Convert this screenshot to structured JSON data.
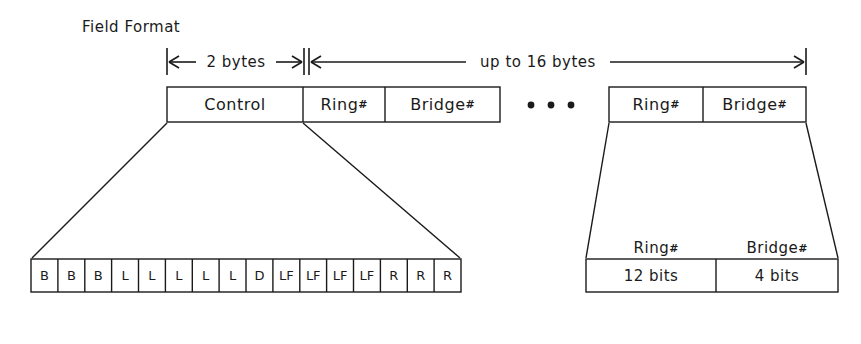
{
  "diagram": {
    "title": "Field Format",
    "stroke_color": "#1a1a1a",
    "background_color": "#ffffff"
  },
  "dimensions": [
    {
      "label": "2 bytes",
      "x_start": 167,
      "x_end": 303
    },
    {
      "label": "up to 16 bytes",
      "x_start": 303,
      "x_end": 806
    }
  ],
  "top_row": {
    "left_group": {
      "fields": [
        {
          "label": "Control",
          "suffix": "",
          "x": 167,
          "width": 136
        },
        {
          "label": "Ring",
          "suffix": "#",
          "x": 303,
          "width": 82
        },
        {
          "label": "Bridge",
          "suffix": "#",
          "x": 385,
          "width": 115
        }
      ]
    },
    "ellipsis": {
      "label": "• • •",
      "dots": 3
    },
    "right_group": {
      "fields": [
        {
          "label": "Ring",
          "suffix": "#",
          "x": 609,
          "width": 94
        },
        {
          "label": "Bridge",
          "suffix": "#",
          "x": 703,
          "width": 103
        }
      ]
    }
  },
  "control_expansion": {
    "bits": [
      "B",
      "B",
      "B",
      "L",
      "L",
      "L",
      "L",
      "L",
      "D",
      "LF",
      "LF",
      "LF",
      "LF",
      "R",
      "R",
      "R"
    ],
    "bit_count": 16
  },
  "route_expansion": {
    "headers": [
      {
        "label": "Ring",
        "suffix": "#"
      },
      {
        "label": "Bridge",
        "suffix": "#"
      }
    ],
    "cells": [
      {
        "label": "12 bits"
      },
      {
        "label": "4 bits"
      }
    ]
  }
}
